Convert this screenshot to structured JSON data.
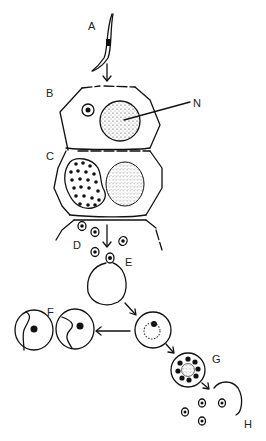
{
  "diagram": {
    "type": "biological life-cycle illustration",
    "labels": {
      "A": "A",
      "B": "B",
      "C": "C",
      "D": "D",
      "E": "E",
      "F": "F",
      "G": "G",
      "H": "H",
      "N": "N"
    },
    "colors": {
      "ink": "#111111",
      "background": "#ffffff"
    }
  }
}
